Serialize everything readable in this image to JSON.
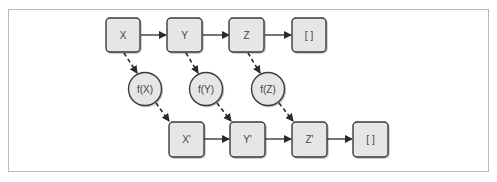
{
  "diagram": {
    "top_row": [
      {
        "id": "x",
        "label": "X"
      },
      {
        "id": "y",
        "label": "Y"
      },
      {
        "id": "z",
        "label": "Z"
      },
      {
        "id": "empty",
        "label": "[ ]"
      }
    ],
    "functions": [
      {
        "id": "fx",
        "label": "f(X)"
      },
      {
        "id": "fy",
        "label": "f(Y)"
      },
      {
        "id": "fz",
        "label": "f(Z)"
      }
    ],
    "bottom_row": [
      {
        "id": "x_prime",
        "label": "X'"
      },
      {
        "id": "y_prime",
        "label": "Y'"
      },
      {
        "id": "z_prime",
        "label": "Z'"
      },
      {
        "id": "empty_prime",
        "label": "[ ]"
      }
    ],
    "colors": {
      "box_fill": "#e6e6e6",
      "box_stroke": "#3a3a3a",
      "arrow": "#2a2a2a",
      "frame": "#b9b9b9"
    }
  }
}
